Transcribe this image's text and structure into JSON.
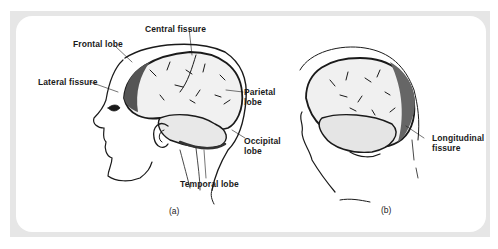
{
  "figure": {
    "panels": [
      {
        "id": "a",
        "caption": "(a)",
        "view": "lateral view of head with brain",
        "labels": {
          "central_fissure": "Central fissure",
          "frontal_lobe": "Frontal lobe",
          "lateral_fissure": "Lateral fissure",
          "parietal_lobe_1": "Parietal",
          "parietal_lobe_2": "lobe",
          "occipital_lobe_1": "Occipital",
          "occipital_lobe_2": "lobe",
          "temporal_lobe": "Temporal lobe"
        }
      },
      {
        "id": "b",
        "caption": "(b)",
        "view": "oblique view of head with brain",
        "labels": {
          "longitudinal_fissure_1": "Longitudinal",
          "longitudinal_fissure_2": "fissure"
        }
      }
    ],
    "colors": {
      "frame": "#e6e6e6",
      "background": "#ffffff",
      "ink": "#1a1a1a"
    }
  }
}
